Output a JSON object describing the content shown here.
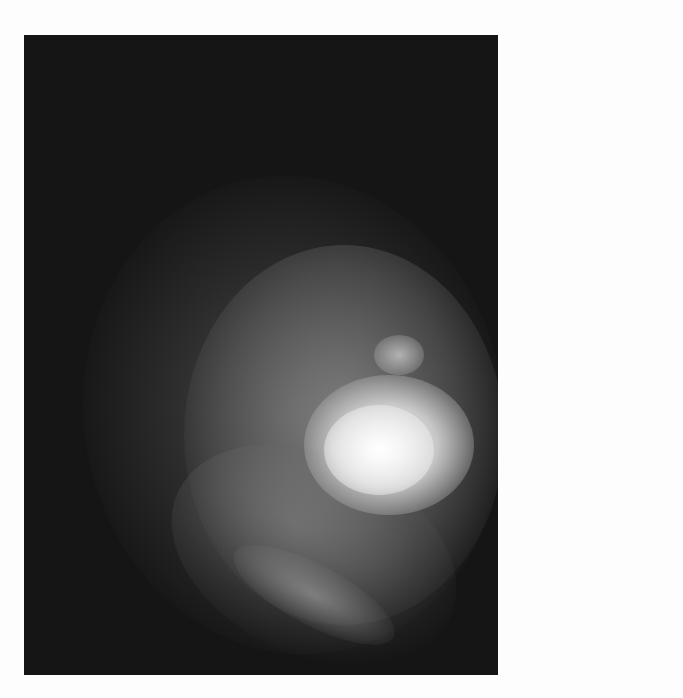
{
  "image": {
    "description": "Grayscale astronomical image of a diffuse glowing nebula with a bright central core on a dark background",
    "colors": {
      "background": "#fdfdfd",
      "sky": "#151515",
      "core": "#f5f5f5"
    }
  }
}
